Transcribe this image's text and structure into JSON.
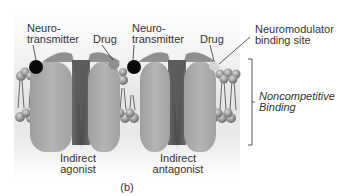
{
  "figure": {
    "panel_label": "(b)",
    "channels": [
      {
        "id": "left",
        "neurotransmitter_label": "Neuro-\ntransmitter",
        "neurotransmitter_label_line1": "Neuro-",
        "neurotransmitter_label_line2": "transmitter",
        "drug_label": "Drug",
        "caption_line1": "Indirect",
        "caption_line2": "agonist",
        "drug_color": "#8a8a8a"
      },
      {
        "id": "right",
        "neurotransmitter_label_line1": "Neuro-",
        "neurotransmitter_label_line2": "transmitter",
        "drug_label": "Drug",
        "caption_line1": "Indirect",
        "caption_line2": "antagonist",
        "drug_color": "#d8d8d8"
      }
    ],
    "binding_site_label_line1": "Neuromodulator",
    "binding_site_label_line2": "binding site",
    "bracket_label_line1": "Noncompetitive",
    "bracket_label_line2": "Binding",
    "colors": {
      "protein": "#a9a9a9",
      "protein_dark": "#6f6f6f",
      "neurotransmitter": "#0a0a0a",
      "lipid_head": "#9c9c9c",
      "background": "#ffffff"
    }
  }
}
